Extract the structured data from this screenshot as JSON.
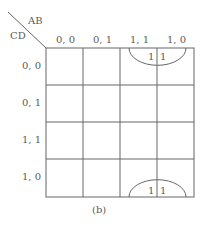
{
  "kmap": {
    "row_var": "CD",
    "col_var": "AB",
    "columns": [
      "0, 0",
      "0, 1",
      "1, 1",
      "1, 0"
    ],
    "rows": [
      "0, 0",
      "0, 1",
      "1, 1",
      "1, 0"
    ],
    "cells": [
      [
        "",
        "",
        "1",
        "1"
      ],
      [
        "",
        "",
        "",
        ""
      ],
      [
        "",
        "",
        "",
        ""
      ],
      [
        "",
        "",
        "1",
        "1"
      ]
    ],
    "groupings": [
      "top-half-loop over row 0,0 columns 1,1 and 1,0",
      "bottom-half-loop over row 1,0 columns 1,1 and 1,0"
    ],
    "caption": "(b)"
  }
}
